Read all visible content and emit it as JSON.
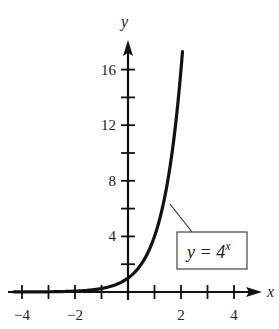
{
  "chart_data": {
    "type": "line",
    "title": "",
    "xlabel": "x",
    "ylabel": "y",
    "xlim": [
      -4.3,
      5
    ],
    "ylim": [
      0,
      18
    ],
    "grid": false,
    "x_ticks": [
      -4,
      -3,
      -2,
      -1,
      0,
      1,
      2,
      3,
      4
    ],
    "x_tick_labels": [
      {
        "value": -4,
        "label": "−4"
      },
      {
        "value": -2,
        "label": "−2"
      },
      {
        "value": 2,
        "label": "2"
      },
      {
        "value": 4,
        "label": "4"
      }
    ],
    "y_ticks": [
      2,
      4,
      6,
      8,
      10,
      12,
      14,
      16
    ],
    "y_tick_labels": [
      {
        "value": 4,
        "label": "4"
      },
      {
        "value": 8,
        "label": "8"
      },
      {
        "value": 12,
        "label": "12"
      },
      {
        "value": 16,
        "label": "16"
      }
    ],
    "series": [
      {
        "name": "y = 4^x",
        "function": "4^x",
        "x": [
          -4,
          -3,
          -2,
          -1,
          0,
          0.5,
          1,
          1.5,
          2
        ],
        "values": [
          0.0039,
          0.0156,
          0.0625,
          0.25,
          1,
          2,
          4,
          8,
          16
        ]
      }
    ],
    "annotations": [
      {
        "text_main": "y = 4",
        "text_sup": "x",
        "boxed": true,
        "points_to_x": 1.5
      }
    ]
  },
  "labels": {
    "x_axis": "x",
    "y_axis": "y",
    "equation_main": "y = 4",
    "equation_exp": "x"
  },
  "colors": {
    "ink": "#111111",
    "box_stroke": "#444444",
    "background": "#ffffff"
  }
}
